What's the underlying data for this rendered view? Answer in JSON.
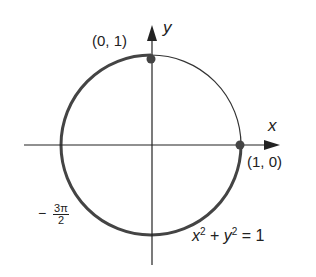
{
  "diagram": {
    "axes": {
      "x_label": "x",
      "y_label": "y"
    },
    "points": [
      {
        "label": "(0, 1)",
        "x": 0,
        "y": 1
      },
      {
        "label": "(1, 0)",
        "x": 1,
        "y": 0
      }
    ],
    "angle_label": {
      "sign": "−",
      "numerator": "3π",
      "denominator": "2"
    },
    "equation": {
      "lhs_x": "x",
      "exp1": "2",
      "plus": " + ",
      "lhs_y": "y",
      "exp2": "2",
      "rhs": " = 1"
    },
    "colors": {
      "line": "#333333",
      "point": "#444444"
    }
  }
}
